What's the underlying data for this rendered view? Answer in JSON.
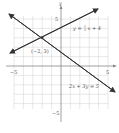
{
  "diagram": {
    "type": "coordinate-plane-system-of-equations",
    "axes": {
      "x_label": "x",
      "y_label": "y",
      "x_range": [
        -5,
        5
      ],
      "y_range": [
        -5,
        5
      ],
      "tick_labels": {
        "x_min": "−5",
        "x_max": "5",
        "y_max": "5",
        "y_min": "−5"
      }
    },
    "lines": [
      {
        "name": "line-1",
        "label_lhs": "y = ",
        "label_frac_num": "1",
        "label_frac_den": "2",
        "label_rhs": "x + 4",
        "equation": "y = 1/2 x + 4"
      },
      {
        "name": "line-2",
        "label": "2x + 3y = 5",
        "equation": "2x + 3y = 5"
      }
    ],
    "intersection": {
      "label": "(−2, 3)",
      "x": -2,
      "y": 3
    },
    "colors": {
      "grid": "#d6d6d6",
      "axis": "#888888",
      "line": "#333333",
      "text": "#555555"
    }
  }
}
